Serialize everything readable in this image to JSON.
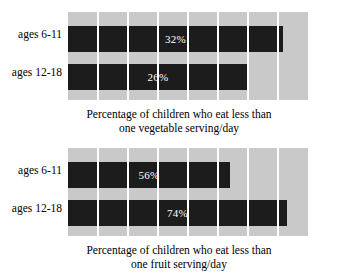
{
  "figure": {
    "background_color": "#ffffff",
    "plot_background_color": "#c9c9c9",
    "bar_color": "#1c1c1c",
    "gridline_color": "#ffffff",
    "value_label_color": "#ffffff"
  },
  "charts": [
    {
      "id": "vegetable-chart",
      "caption_line1": "Percentage of children who eat less than",
      "caption_line2": "one vegetable serving/day",
      "bars": [
        {
          "label": "ages 6-11",
          "value_text": "32%",
          "value": 32
        },
        {
          "label": "ages 12-18",
          "value_text": "26%",
          "value": 26
        }
      ]
    },
    {
      "id": "fruit-chart",
      "caption_line1": "Percentage of children who eat less than",
      "caption_line2": "one fruit serving/day",
      "bars": [
        {
          "label": "ages 6-11",
          "value_text": "56%",
          "value": 56
        },
        {
          "label": "ages 12-18",
          "value_text": "74%",
          "value": 74
        }
      ]
    }
  ],
  "chart_data": [
    {
      "type": "bar",
      "orientation": "horizontal",
      "title": "",
      "caption": "Percentage of children who eat less than one vegetable serving/day",
      "categories": [
        "ages 6-11",
        "ages 12-18"
      ],
      "values": [
        32,
        26
      ],
      "data_labels": [
        "32%",
        "26%"
      ],
      "xlabel": "",
      "ylabel": "",
      "xlim": [
        0,
        80
      ],
      "grid": true,
      "gridlines_count": 7,
      "legend": "none",
      "note": "Bar lengths are not drawn proportional to their values (32% bar is drawn nearly as long as the 74% bar in the companion chart); the graph is visually distorted."
    },
    {
      "type": "bar",
      "orientation": "horizontal",
      "title": "",
      "caption": "Percentage of children who eat less than one fruit serving/day",
      "categories": [
        "ages 6-11",
        "ages 12-18"
      ],
      "values": [
        56,
        74
      ],
      "data_labels": [
        "56%",
        "74%"
      ],
      "xlabel": "",
      "ylabel": "",
      "xlim": [
        0,
        80
      ],
      "grid": true,
      "gridlines_count": 7,
      "legend": "none",
      "note": "Bar lengths are not drawn proportional to their values; the graph is visually distorted."
    }
  ]
}
